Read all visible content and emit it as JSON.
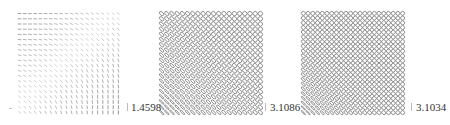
{
  "figure": {
    "panels": [
      {
        "id": "panel-1",
        "glyph_type": "line",
        "grid": {
          "cols": 20,
          "rows": 20
        },
        "left": 14,
        "color": "#8a8a8a",
        "scale_label": "1.4598",
        "description": "Line glyphs: horizontal at top-left, rotating to vertical at bottom-right"
      },
      {
        "id": "panel-2",
        "glyph_type": "ellipse",
        "grid": {
          "cols": 20,
          "rows": 20
        },
        "left": 156,
        "color": "#7a7a7a",
        "scale_label": "3.1086",
        "description": "Ellipse glyphs: elongated diagonal (\\) in lower-left, near-circular at top-right"
      },
      {
        "id": "panel-3",
        "glyph_type": "ellipse",
        "grid": {
          "cols": 22,
          "rows": 22
        },
        "left": 298,
        "color": "#7a7a7a",
        "scale_label": "3.1034",
        "description": "Small ellipse glyphs: mostly circular (checkered look), diagonal in lower-left corner"
      }
    ]
  }
}
